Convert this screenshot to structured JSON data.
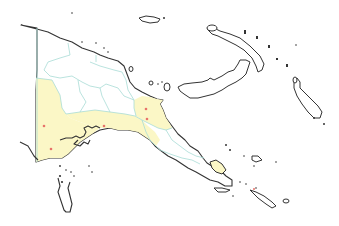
{
  "map": {
    "title": "",
    "region": "Papua New Guinea",
    "colors": {
      "background": "#ffffff",
      "highlighted_province": "#fbf7c6",
      "unhighlighted_province": "#ffffff",
      "province_border": "#a8dcd6",
      "coastline": "#333333",
      "marker": "#e8736a"
    },
    "highlighted_regions": [
      {
        "name": "western-region",
        "fill": "#fbf7c6"
      },
      {
        "name": "gulf-region",
        "fill": "#fbf7c6"
      },
      {
        "name": "morobe-region",
        "fill": "#fbf7c6"
      },
      {
        "name": "milne-bay-island",
        "fill": "#fbf7c6"
      }
    ],
    "markers": [
      {
        "id": "marker-1",
        "x": 44,
        "y": 126
      },
      {
        "id": "marker-2",
        "x": 51,
        "y": 149
      },
      {
        "id": "marker-3",
        "x": 104,
        "y": 126
      },
      {
        "id": "marker-4",
        "x": 146,
        "y": 109
      },
      {
        "id": "marker-5",
        "x": 147,
        "y": 119
      }
    ]
  }
}
